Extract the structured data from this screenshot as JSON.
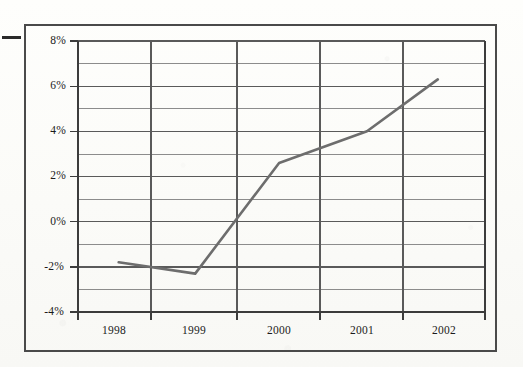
{
  "figure": {
    "background_color": "#fdfdfb",
    "frame_color": "#4a4a4a",
    "margin_dash": "margin-rule-dash"
  },
  "chart_data": {
    "type": "line",
    "title": "",
    "subtitle": "",
    "xlabel": "",
    "ylabel": "",
    "categories": [
      "1998",
      "1999",
      "2000",
      "2001",
      "2002"
    ],
    "x": [
      1998,
      1999,
      2000,
      2001,
      2002
    ],
    "series": [
      {
        "name": "",
        "values": [
          -1.8,
          -2.3,
          2.6,
          4.0,
          6.3
        ],
        "color": "#6d6d6d",
        "line_width": 2.6,
        "markers": false
      }
    ],
    "values": [
      -1.8,
      -2.3,
      2.6,
      4.0,
      6.3
    ],
    "ylim": [
      -4,
      8
    ],
    "xlim": [
      1997.5,
      2002.5
    ],
    "ytick_values": [
      8,
      6,
      4,
      2,
      0,
      -2,
      -4
    ],
    "ytick_labels": [
      "8%",
      "6%",
      "4%",
      "2%",
      "0%",
      "-2%",
      "-4%"
    ],
    "yminor_tick_values": [
      7,
      5,
      3,
      1,
      -1,
      -3
    ],
    "xtick_labels": [
      "1998",
      "1999",
      "2000",
      "2001",
      "2002"
    ],
    "grid": {
      "horizontal": true,
      "vertical": true,
      "minor_horizontal": true,
      "color": "#5f5f5f",
      "minor_color": "#7a7a7a"
    },
    "legend": {
      "visible": false,
      "position": "none",
      "entries": []
    },
    "axis": {
      "line_color": "#4a4a4a",
      "tick_marks": true,
      "percent_units": true
    },
    "annotations": []
  },
  "axis_labels": {
    "y": [
      {
        "text": "8%",
        "value": 8
      },
      {
        "text": "6%",
        "value": 6
      },
      {
        "text": "4%",
        "value": 4
      },
      {
        "text": "2%",
        "value": 2
      },
      {
        "text": "0%",
        "value": 0
      },
      {
        "text": "-2%",
        "value": -2
      },
      {
        "text": "-4%",
        "value": -4
      }
    ],
    "x": [
      {
        "text": "1998"
      },
      {
        "text": "1999"
      },
      {
        "text": "2000"
      },
      {
        "text": "2001"
      },
      {
        "text": "2002"
      }
    ]
  }
}
